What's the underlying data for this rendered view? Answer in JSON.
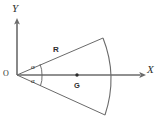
{
  "figure": {
    "kind": "geometry-diagram",
    "background_color": "#ffffff",
    "line_color": "#6a6a6a",
    "text_color": "#2e2e2e",
    "width": 161,
    "height": 127
  },
  "axes": {
    "x_label": "X",
    "y_label": "Y",
    "origin_label": "O"
  },
  "labels": {
    "radius": "R",
    "centroid": "G",
    "angle_upper": "α",
    "angle_lower": "α"
  },
  "geometry": {
    "origin": {
      "x": 17,
      "y": 75
    },
    "x_axis_end": {
      "x": 145,
      "y": 75
    },
    "y_axis_top": {
      "x": 17,
      "y": 21
    },
    "sector_top_vertex": {
      "x": 103,
      "y": 38
    },
    "sector_bottom_vertex": {
      "x": 105,
      "y": 115
    },
    "arc_bulge_x": 114,
    "radius_px": 94,
    "half_angle_deg": 23,
    "centroid_point": {
      "x": 77,
      "y": 75
    }
  }
}
